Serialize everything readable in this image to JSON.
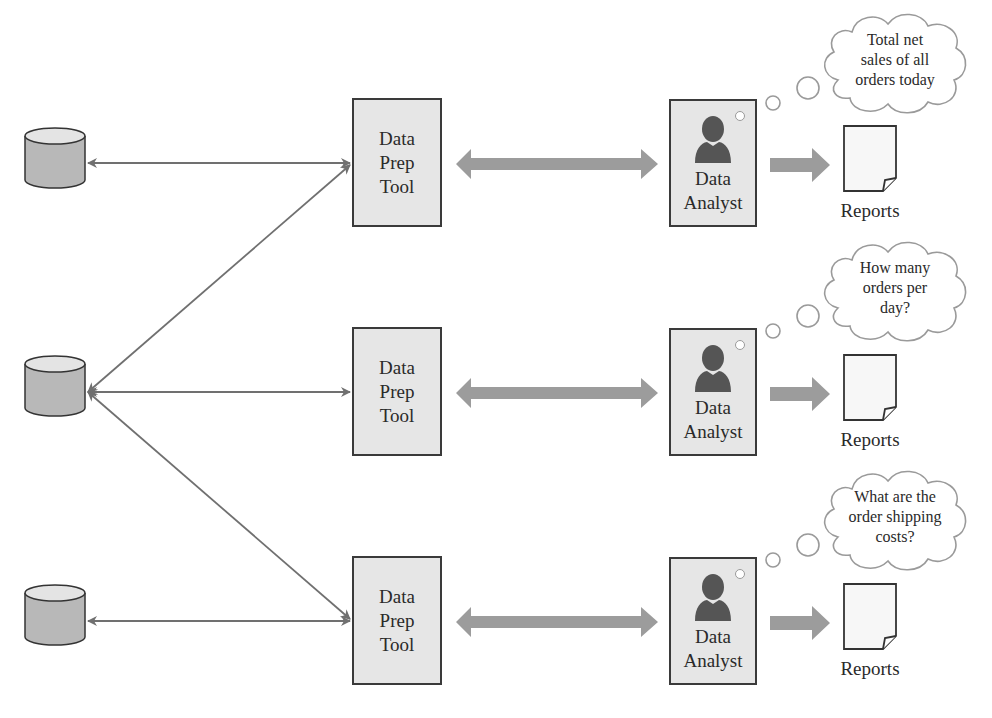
{
  "diagram": {
    "type": "data-flow",
    "rows": [
      {
        "database_icon": "database-cylinder-icon",
        "prep_tool": {
          "label": "Data\nPrep\nTool"
        },
        "analyst": {
          "label": "Data\nAnalyst",
          "icon": "person-icon"
        },
        "output": {
          "label": "Reports",
          "icon": "document-icon"
        },
        "thought": "Total net\nsales of all\norders today"
      },
      {
        "database_icon": "database-cylinder-icon",
        "prep_tool": {
          "label": "Data\nPrep\nTool"
        },
        "analyst": {
          "label": "Data\nAnalyst",
          "icon": "person-icon"
        },
        "output": {
          "label": "Reports",
          "icon": "document-icon"
        },
        "thought": "How many\norders per\nday?"
      },
      {
        "database_icon": "database-cylinder-icon",
        "prep_tool": {
          "label": "Data\nPrep\nTool"
        },
        "analyst": {
          "label": "Data\nAnalyst",
          "icon": "person-icon"
        },
        "output": {
          "label": "Reports",
          "icon": "document-icon"
        },
        "thought": "What are the\norder shipping\ncosts?"
      }
    ],
    "colors": {
      "box_fill": "#e6e6e6",
      "box_border": "#3a3a3a",
      "big_arrow": "#9c9c9c",
      "thin_arrow": "#707070",
      "database_fill": "#b8b8b8",
      "person": "#555555"
    }
  }
}
